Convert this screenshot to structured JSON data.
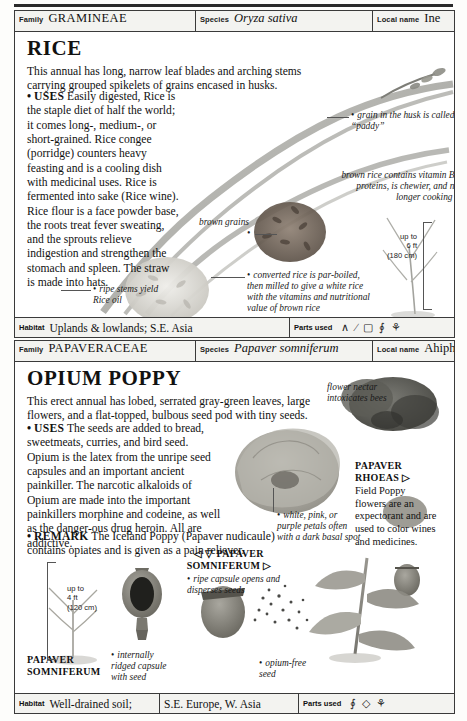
{
  "page": {
    "width": 467,
    "height": 721,
    "background": "#fdfdfb",
    "ink": "#111111"
  },
  "entries": [
    {
      "id": "rice",
      "header": {
        "family_key": "Family",
        "family_value": "GRAMINEAE",
        "species_key": "Species",
        "species_value": "Oryza sativa",
        "local_key": "Local name",
        "local_value": "Ine"
      },
      "title": "RICE",
      "intro": "This annual has long, narrow leaf blades and arching stems carrying grouped spikelets of grains encased in husks.",
      "sections": [
        {
          "lead": "USES",
          "text": "Easily digested, Rice is the staple diet of half the world; it comes long-, medium-, or short-grained. Rice congee (porridge) counters heavy feasting and is a cooling dish with medicinal uses. Rice is fermented into sake (Rice wine). Rice flour is a face powder base, the roots treat fever sweating, and the sprouts relieve indigestion and strengthen the stomach and spleen. The straw is made into hats."
        }
      ],
      "callouts": [
        {
          "id": "paddy",
          "text": "grain in the husk is called “paddy”"
        },
        {
          "id": "brown-rice",
          "text": "brown rice contains vitamin B and proteins, is chewier, and needs longer cooking time"
        },
        {
          "id": "brown-grains",
          "text": "brown grains"
        },
        {
          "id": "converted-rice",
          "text": "converted rice is par-boiled, then milled to give a white rice with the vitamins and nutritional value of brown rice"
        },
        {
          "id": "ripe-stems",
          "text": "ripe stems yield Rice oil"
        }
      ],
      "scale": {
        "line1": "up to",
        "line2": "6 ft",
        "line3": "(180 cm)"
      },
      "footer": {
        "habitat_key": "Habitat",
        "habitat_value": "Uplands & lowlands; S.E. Asia",
        "parts_key": "Parts used",
        "parts_icons": [
          "leaf-icon",
          "stem-icon",
          "seed-icon",
          "grain-pair-icon",
          "flower-cluster-icon"
        ]
      }
    },
    {
      "id": "opium-poppy",
      "header": {
        "family_key": "Family",
        "family_value": "PAPAVERACEAE",
        "species_key": "Species",
        "species_value": "Papaver somniferum",
        "local_key": "Local name",
        "local_value": "Ahiphenalm"
      },
      "title": "OPIUM POPPY",
      "intro": "This erect annual has lobed, serrated gray-green leaves, large flowers, and a flat-topped, bulbous seed pod with tiny seeds.",
      "sections": [
        {
          "lead": "USES",
          "text": "The seeds are added to bread, sweetmeats, curries, and bird seed. Opium is the latex from the unripe seed capsules and an important ancient painkiller. The narcotic alkaloids of Opium are made into the important painkillers morphine and codeine, as well as the danger-ous drug heroin. All are addictive."
        },
        {
          "lead": "REMARK",
          "text": "The Iceland Poppy (Papaver nudicaule) contains opiates and is given as a pain reliever."
        }
      ],
      "callouts": [
        {
          "id": "nectar",
          "text": "flower nectar intoxicates bees"
        },
        {
          "id": "petals",
          "text": "white, pink, or purple petals often with a dark basal spot"
        },
        {
          "id": "ripe-capsule",
          "text": "ripe capsule opens and disperses seeds"
        },
        {
          "id": "internally-ridged",
          "text": "internally ridged capsule with seed"
        },
        {
          "id": "opium-free",
          "text": "opium-free seed"
        }
      ],
      "side_note": {
        "title_line1": "PAPAVER",
        "title_line2": "RHOEAS",
        "marker": "▷",
        "text": "Field Poppy flowers are an expectorant and are used to color wines and medicines."
      },
      "plate_labels": [
        {
          "id": "plate-top",
          "marker_left": "◁ ▽",
          "line1": "PAPAVER",
          "line2": "SOMNIFERUM",
          "marker_right": "▷"
        },
        {
          "id": "plate-bottom",
          "line1": "PAPAVER",
          "line2": "SOMNIFERUM"
        }
      ],
      "scale": {
        "line1": "up to",
        "line2": "4 ft",
        "line3": "(120 cm)"
      },
      "footer": {
        "habitat_key": "Habitat",
        "habitat_value": "Well-drained soil;",
        "habitat_region": "S.E. Europe, W. Asia",
        "parts_key": "Parts used",
        "parts_icons": [
          "seed-pair-icon",
          "latex-drop-icon",
          "flower-cluster-icon"
        ]
      }
    }
  ]
}
